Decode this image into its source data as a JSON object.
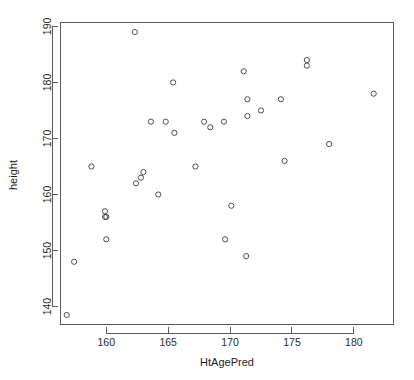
{
  "chart_data": {
    "type": "scatter",
    "title": "",
    "subtitle": "",
    "xlabel": "HtAgePred",
    "ylabel": "height",
    "xlim": [
      156.3,
      183.2
    ],
    "ylim": [
      136.8,
      190.7
    ],
    "xticks": [
      160,
      165,
      170,
      175,
      180
    ],
    "xtick_labels": [
      "160",
      "165",
      "170",
      "175",
      "180"
    ],
    "yticks": [
      140,
      150,
      160,
      170,
      180,
      190
    ],
    "ytick_labels": [
      "140",
      "150",
      "160",
      "170",
      "180",
      "190"
    ],
    "grid": false,
    "legend": null,
    "point_marker": "open-circle",
    "point_color": "#4d4d55",
    "n_points": 33,
    "x": [
      162.3,
      176.2,
      176.2,
      181.6,
      165.4,
      171.1,
      171.4,
      174.1,
      172.5,
      171.4,
      163.6,
      164.8,
      167.9,
      169.5,
      168.4,
      165.5,
      178.0,
      174.4,
      158.8,
      167.2,
      163.0,
      162.4,
      162.8,
      164.2,
      170.1,
      159.9,
      160.0,
      159.9,
      169.6,
      160.0,
      171.3,
      157.4,
      156.8
    ],
    "y": [
      189.0,
      184.0,
      183.0,
      178.0,
      180.0,
      182.0,
      177.0,
      177.0,
      175.0,
      174.0,
      173.0,
      173.0,
      173.0,
      173.0,
      172.0,
      171.0,
      169.0,
      166.0,
      165.0,
      165.0,
      164.0,
      162.0,
      163.0,
      160.0,
      158.0,
      157.0,
      156.0,
      156.0,
      152.0,
      152.0,
      149.0,
      148.0,
      138.5
    ],
    "points": [
      {
        "x": 162.3,
        "y": 189.0
      },
      {
        "x": 176.2,
        "y": 184.0
      },
      {
        "x": 176.2,
        "y": 183.0
      },
      {
        "x": 181.6,
        "y": 178.0
      },
      {
        "x": 165.4,
        "y": 180.0
      },
      {
        "x": 171.1,
        "y": 182.0
      },
      {
        "x": 171.4,
        "y": 177.0
      },
      {
        "x": 174.1,
        "y": 177.0
      },
      {
        "x": 172.5,
        "y": 175.0
      },
      {
        "x": 171.4,
        "y": 174.0
      },
      {
        "x": 163.6,
        "y": 173.0
      },
      {
        "x": 164.8,
        "y": 173.0
      },
      {
        "x": 167.9,
        "y": 173.0
      },
      {
        "x": 169.5,
        "y": 173.0
      },
      {
        "x": 168.4,
        "y": 172.0
      },
      {
        "x": 165.5,
        "y": 171.0
      },
      {
        "x": 178.0,
        "y": 169.0
      },
      {
        "x": 174.4,
        "y": 166.0
      },
      {
        "x": 158.8,
        "y": 165.0
      },
      {
        "x": 167.2,
        "y": 165.0
      },
      {
        "x": 163.0,
        "y": 164.0
      },
      {
        "x": 162.4,
        "y": 162.0
      },
      {
        "x": 162.8,
        "y": 163.0
      },
      {
        "x": 164.2,
        "y": 160.0
      },
      {
        "x": 170.1,
        "y": 158.0
      },
      {
        "x": 159.9,
        "y": 157.0
      },
      {
        "x": 160.0,
        "y": 156.0
      },
      {
        "x": 159.9,
        "y": 156.0
      },
      {
        "x": 169.6,
        "y": 152.0
      },
      {
        "x": 160.0,
        "y": 152.0
      },
      {
        "x": 171.3,
        "y": 149.0
      },
      {
        "x": 157.4,
        "y": 148.0
      },
      {
        "x": 156.8,
        "y": 138.5
      }
    ]
  },
  "axes": {
    "x_title": "HtAgePred",
    "y_title": "height"
  }
}
